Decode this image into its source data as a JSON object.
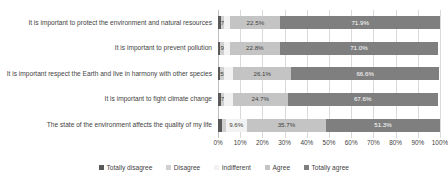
{
  "chart_data": {
    "type": "bar",
    "orientation": "horizontal",
    "stacked": true,
    "title": "",
    "xlabel": "",
    "ylabel": "",
    "xlim": [
      0,
      100
    ],
    "grid": true,
    "legend_position": "bottom",
    "categories": [
      "It is important to protect the environment and natural resources",
      "It is important to prevent pollution",
      "It is important respect the Earth and live in harmony with other species",
      "It is important to fight climate change",
      "The state of the environment affects the quality of my life"
    ],
    "tick_labels": [
      "0%",
      "10%",
      "20%",
      "30%",
      "40%",
      "50%",
      "60%",
      "70%",
      "80%",
      "90%",
      "100%"
    ],
    "tick_values": [
      0,
      10,
      20,
      30,
      40,
      50,
      60,
      70,
      80,
      90,
      100
    ],
    "series": [
      {
        "name": "Totally disagree",
        "color": "#595959",
        "values": [
          1.2,
          1.0,
          1.1,
          1.2,
          1.6
        ],
        "labels": [
          "",
          "",
          "",
          "",
          ""
        ]
      },
      {
        "name": "Disagree",
        "color": "#d0d0d0",
        "values": [
          1.7,
          1.9,
          1.5,
          1.7,
          1.8
        ],
        "labels": [
          "1.7%",
          "1.9%",
          "1.5%",
          "1.7%",
          ""
        ]
      },
      {
        "name": "Indifferent",
        "color": "#f2f2f2",
        "values": [
          2.7,
          2.3,
          4.3,
          3.8,
          9.6
        ],
        "labels": [
          "",
          "",
          "",
          "",
          "9.6%"
        ]
      },
      {
        "name": "Agree",
        "color": "#c4c4c4",
        "values": [
          22.5,
          22.8,
          26.1,
          24.7,
          35.7
        ],
        "labels": [
          "22.5%",
          "22.8%",
          "26.1%",
          "24.7%",
          "35.7%"
        ]
      },
      {
        "name": "Totally agree",
        "color": "#7f7f7f",
        "values": [
          71.9,
          71.0,
          66.6,
          67.6,
          51.3
        ],
        "labels": [
          "71.9%",
          "71.0%",
          "66.6%",
          "67.6%",
          "51.3%"
        ]
      }
    ]
  }
}
